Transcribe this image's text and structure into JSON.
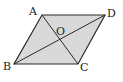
{
  "diagram": {
    "type": "parallelogram",
    "fill_color": "#d9d9d9",
    "stroke_color": "#2a2a2a",
    "vertices": {
      "A": [
        42,
        15
      ],
      "D": [
        105,
        15
      ],
      "C": [
        78,
        64
      ],
      "B": [
        14,
        64
      ]
    },
    "intersection": {
      "O": [
        60,
        39
      ]
    },
    "labels": {
      "A": "A",
      "B": "B",
      "C": "C",
      "D": "D",
      "O": "O"
    },
    "diagonals": [
      "AC",
      "BD"
    ]
  }
}
